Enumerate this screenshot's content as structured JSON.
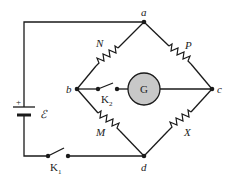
{
  "diagram": {
    "nodes": {
      "a": "a",
      "b": "b",
      "c": "c",
      "d": "d"
    },
    "resistors": {
      "N": "N",
      "P": "P",
      "M": "M",
      "X": "X"
    },
    "galvanometer": "G",
    "battery": {
      "plus": "+",
      "emf": "ℰ"
    },
    "switches": {
      "k1": {
        "letter": "K",
        "sub": "1"
      },
      "k2": {
        "letter": "K",
        "sub": "2"
      }
    },
    "colors": {
      "wire": "#1a1a1a",
      "galvanometer_fill": "#c8c8c8"
    }
  }
}
